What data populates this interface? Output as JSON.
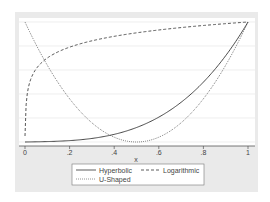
{
  "chart_data": {
    "type": "line",
    "title": "",
    "xlabel": "x",
    "ylabel": "",
    "xlim": [
      0,
      1
    ],
    "ylim": [
      0,
      1
    ],
    "grid": true,
    "legend_position": "bottom",
    "x_ticks": [
      "0",
      ".2",
      ".4",
      ".6",
      ".8",
      "1"
    ],
    "x": [
      0,
      0.05,
      0.1,
      0.15,
      0.2,
      0.25,
      0.3,
      0.35,
      0.4,
      0.45,
      0.5,
      0.55,
      0.6,
      0.65,
      0.7,
      0.75,
      0.8,
      0.85,
      0.9,
      0.95,
      1
    ],
    "series": [
      {
        "name": "Hyperbolic",
        "style": "solid",
        "values": [
          0.0,
          0.0,
          0.01,
          0.01,
          0.02,
          0.03,
          0.05,
          0.07,
          0.09,
          0.12,
          0.15,
          0.19,
          0.24,
          0.3,
          0.37,
          0.45,
          0.54,
          0.64,
          0.75,
          0.87,
          1.0
        ]
      },
      {
        "name": "Logarithmic",
        "style": "dashed",
        "values": [
          0.05,
          0.48,
          0.6,
          0.66,
          0.7,
          0.73,
          0.76,
          0.78,
          0.8,
          0.82,
          0.84,
          0.85,
          0.87,
          0.88,
          0.9,
          0.91,
          0.92,
          0.94,
          0.96,
          0.98,
          1.0
        ]
      },
      {
        "name": "U-Shaped",
        "style": "dotted",
        "values": [
          1.0,
          0.81,
          0.64,
          0.49,
          0.36,
          0.25,
          0.16,
          0.09,
          0.04,
          0.01,
          0.0,
          0.01,
          0.04,
          0.09,
          0.16,
          0.25,
          0.36,
          0.49,
          0.64,
          0.81,
          1.0
        ]
      }
    ]
  },
  "legend": {
    "items": [
      {
        "label": "Hyperbolic",
        "style": "solid"
      },
      {
        "label": "Logarithmic",
        "style": "dashed"
      },
      {
        "label": "U-Shaped",
        "style": "dotted"
      }
    ]
  },
  "axis": {
    "xlabel": "x"
  }
}
